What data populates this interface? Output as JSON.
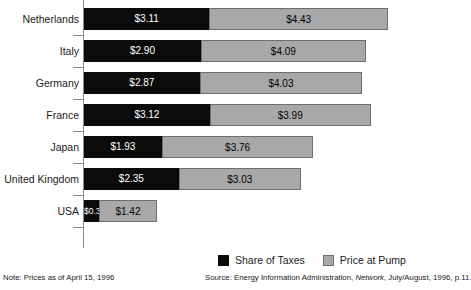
{
  "chart_data": {
    "type": "bar",
    "orientation": "horizontal",
    "stacked": true,
    "title": "",
    "xlabel": "",
    "ylabel": "",
    "grid": false,
    "legend_position": "bottom-right",
    "categories": [
      "Netherlands",
      "Italy",
      "Germany",
      "France",
      "Japan",
      "United Kingdom",
      "USA"
    ],
    "series": [
      {
        "name": "Share of Taxes",
        "color": "#0b0b0b",
        "values": [
          3.11,
          2.9,
          2.87,
          3.12,
          1.93,
          2.35,
          0.38
        ],
        "labels": [
          "$3.11",
          "$2.90",
          "$2.87",
          "$3.12",
          "$1.93",
          "$2.35",
          "$0.38"
        ]
      },
      {
        "name": "Price at Pump",
        "color": "#a8a8a8",
        "values": [
          4.43,
          4.09,
          4.03,
          3.99,
          3.76,
          3.03,
          1.42
        ],
        "labels": [
          "$4.43",
          "$4.09",
          "$4.03",
          "$3.99",
          "$3.76",
          "$3.03",
          "$1.42"
        ]
      }
    ],
    "totals": [
      7.54,
      6.99,
      6.9,
      7.11,
      5.69,
      5.38,
      1.8
    ],
    "xlim": [
      0,
      7.54
    ],
    "annotations": [
      "Note: Prices as of April 15, 1996",
      "Source: Energy Information Administration, Network, July/August, 1996, p.11."
    ]
  },
  "rows": [
    {
      "label": "Netherlands",
      "tax_label": "$3.11",
      "pump_label": "$4.43"
    },
    {
      "label": "Italy",
      "tax_label": "$2.90",
      "pump_label": "$4.09"
    },
    {
      "label": "Germany",
      "tax_label": "$2.87",
      "pump_label": "$4.03"
    },
    {
      "label": "France",
      "tax_label": "$3.12",
      "pump_label": "$3.99"
    },
    {
      "label": "Japan",
      "tax_label": "$1.93",
      "pump_label": "$3.76"
    },
    {
      "label": "United Kingdom",
      "tax_label": "$2.35",
      "pump_label": "$3.03"
    },
    {
      "label": "USA",
      "tax_label": "$0.38",
      "pump_label": "$1.42"
    }
  ],
  "legend": {
    "taxes_label": "Share of Taxes",
    "pump_label": "Price at Pump"
  },
  "footer": {
    "note": "Note: Prices as of April 15, 1996",
    "source_prefix": "Source: Energy Information Administration, ",
    "source_italic": "Network",
    "source_suffix": ", July/August, 1996, p.11."
  },
  "colors": {
    "taxes": "#0b0b0b",
    "pump": "#a8a8a8",
    "pump_border": "#6e6e6e",
    "axis": "#8a8a8a"
  }
}
